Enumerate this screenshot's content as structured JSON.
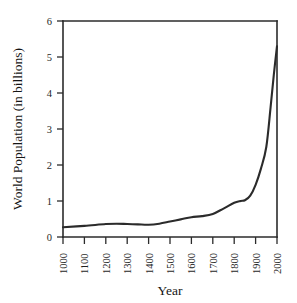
{
  "chart_data": {
    "type": "line",
    "title": "",
    "xlabel": "Year",
    "ylabel": "World Population (in billions)",
    "xlim": [
      1000,
      2000
    ],
    "ylim": [
      0,
      6
    ],
    "grid": false,
    "legend": false,
    "line_color": "#2b2b2b",
    "x_tick_labels": [
      "1000",
      "1100",
      "1200",
      "1300",
      "1400",
      "1500",
      "1600",
      "1700",
      "1800",
      "1900",
      "2000"
    ],
    "y_tick_labels": [
      "0",
      "1",
      "2",
      "3",
      "4",
      "5",
      "6"
    ],
    "x_ticks": [
      1000,
      1100,
      1200,
      1300,
      1400,
      1500,
      1600,
      1700,
      1800,
      1900,
      2000
    ],
    "y_ticks": [
      0,
      1,
      2,
      3,
      4,
      5,
      6
    ],
    "x": [
      1000,
      1100,
      1200,
      1250,
      1300,
      1350,
      1400,
      1450,
      1500,
      1550,
      1600,
      1650,
      1700,
      1750,
      1800,
      1830,
      1850,
      1875,
      1900,
      1925,
      1950,
      1970,
      1985,
      2000
    ],
    "values": [
      0.27,
      0.31,
      0.36,
      0.37,
      0.36,
      0.35,
      0.34,
      0.37,
      0.43,
      0.49,
      0.55,
      0.58,
      0.64,
      0.79,
      0.95,
      1.0,
      1.02,
      1.15,
      1.45,
      1.9,
      2.5,
      3.6,
      4.5,
      5.3
    ],
    "series": [
      {
        "name": "World Population",
        "values": [
          0.27,
          0.31,
          0.36,
          0.37,
          0.36,
          0.35,
          0.34,
          0.37,
          0.43,
          0.49,
          0.55,
          0.58,
          0.64,
          0.79,
          0.95,
          1.0,
          1.02,
          1.15,
          1.45,
          1.9,
          2.5,
          3.6,
          4.5,
          5.3
        ]
      }
    ]
  },
  "figure": {
    "xlabel": "Year",
    "ylabel": "World Population (in billions)"
  }
}
